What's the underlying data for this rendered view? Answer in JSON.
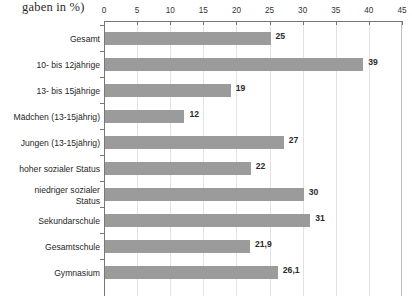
{
  "chart_data": {
    "type": "bar",
    "orientation": "horizontal",
    "title": "gaben in %)",
    "xlabel": "",
    "ylabel": "",
    "xlim": [
      0,
      45
    ],
    "grid": true,
    "legend": false,
    "tick_labels": [
      "0",
      "5",
      "10",
      "15",
      "20",
      "25",
      "30",
      "35",
      "40",
      "45"
    ],
    "ticks": [
      0,
      5,
      10,
      15,
      20,
      25,
      30,
      35,
      40,
      45
    ],
    "categories": [
      "Gesamt",
      "10- bis 12jährige",
      "13- bis 15jährige",
      "Mädchen (13-15jährig)",
      "Jungen (13-15jährig)",
      "hoher sozialer Status",
      "niedriger sozialer Status",
      "Sekundarschule",
      "Gesamtschule",
      "Gymnasium"
    ],
    "values": [
      25,
      39,
      19,
      12,
      27,
      22,
      30,
      31,
      21.9,
      26.1
    ],
    "value_labels": [
      "25",
      "39",
      "19",
      "12",
      "27",
      "22",
      "30",
      "31",
      "21,9",
      "26,1"
    ],
    "bar_color": "#9b9b9b",
    "grid_color": "#e2e2e2",
    "axis_color": "#767676"
  }
}
